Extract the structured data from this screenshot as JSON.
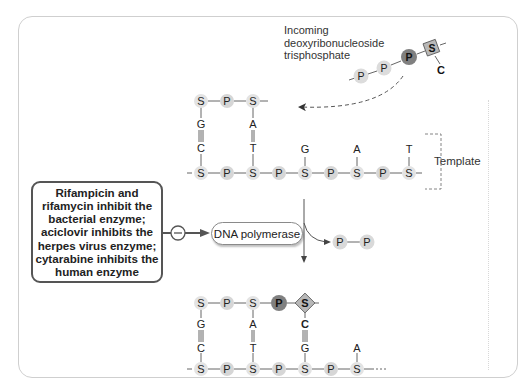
{
  "incoming_label": {
    "line1": "Incoming",
    "line2": "deoxyribonucleoside",
    "line3": "trisphosphate"
  },
  "template_label": "Template",
  "inhibitor_box": {
    "text": "Rifampicin and\nrifamycin inhibit the\nbacterial enzyme;\naciclovir inhibits the\nherpes virus enzyme;\ncytarabine inhibits the\nhuman enzyme"
  },
  "inhibition_symbol": "−",
  "enzyme_label": "DNA polymerase",
  "released_pyrophosphate": [
    "P",
    "P"
  ],
  "incoming_nucleotide": {
    "phosphates": [
      "P",
      "P",
      "P"
    ],
    "sugar": "S",
    "base": "C"
  },
  "before": {
    "new_strand": [
      "S",
      "P",
      "S"
    ],
    "new_bases": [
      "G",
      "A"
    ],
    "template_bases": [
      "C",
      "T",
      "G",
      "A",
      "T"
    ],
    "template_strand": [
      "S",
      "P",
      "S",
      "P",
      "S",
      "P",
      "S",
      "P",
      "S"
    ],
    "bonds": [
      "|||",
      "||"
    ]
  },
  "after": {
    "new_strand": [
      "S",
      "P",
      "S",
      "P",
      "S"
    ],
    "new_bases": [
      "G",
      "A",
      "C"
    ],
    "template_bases": [
      "C",
      "T",
      "G",
      "A"
    ],
    "template_strand": [
      "S",
      "P",
      "S",
      "P",
      "S",
      "P",
      "S"
    ],
    "bonds": [
      "|||",
      "||",
      "|||"
    ]
  },
  "colors": {
    "node_light": "#d9d9d9",
    "node_dark": "#7f7f7f",
    "line": "#555555",
    "text": "#222222"
  }
}
